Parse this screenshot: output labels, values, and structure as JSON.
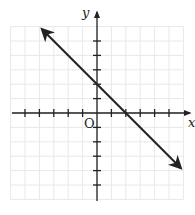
{
  "chart_data": {
    "type": "line",
    "title": "",
    "xlabel": "x",
    "ylabel": "y",
    "origin_label": "O",
    "xlim": [
      -6,
      6
    ],
    "ylim": [
      -6,
      6
    ],
    "grid": true,
    "x_ticks": [
      -5,
      -4,
      -3,
      -2,
      -1,
      1,
      2,
      3,
      4,
      5
    ],
    "y_ticks": [
      -5,
      -4,
      -3,
      -2,
      -1,
      1,
      2,
      3,
      4,
      5
    ],
    "tick_labels_shown": false,
    "series": [
      {
        "name": "line",
        "equation": "y = -x + 2",
        "slope": -1,
        "y_intercept": 2,
        "x_intercept": 2,
        "x": [
          -3.8,
          5.8
        ],
        "y": [
          5.8,
          -3.8
        ],
        "arrows_both_ends": true,
        "color": "#222222"
      }
    ]
  }
}
